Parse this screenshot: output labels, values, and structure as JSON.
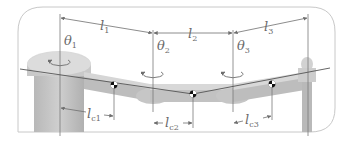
{
  "figure": {
    "links": [
      {
        "length_label": "l",
        "length_sub": "1",
        "com_label": "l",
        "com_sub": "c1"
      },
      {
        "length_label": "l",
        "length_sub": "2",
        "com_label": "l",
        "com_sub": "c2"
      },
      {
        "length_label": "l",
        "length_sub": "3",
        "com_label": "l",
        "com_sub": "c3"
      }
    ],
    "joints": [
      {
        "angle_label": "θ",
        "angle_sub": "1"
      },
      {
        "angle_label": "θ",
        "angle_sub": "2"
      },
      {
        "angle_label": "θ",
        "angle_sub": "3"
      }
    ],
    "colors": {
      "frame": "#c8c8c8",
      "line": "#6e6e6e",
      "link_body": "#bdbdbd",
      "link_top": "#dadada",
      "com_marker": "#111111"
    }
  }
}
